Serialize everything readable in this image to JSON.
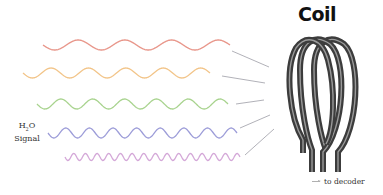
{
  "title": "Coil",
  "signal_label": {
    "prefix": "H",
    "subscript": "2",
    "suffix": "O",
    "line2": "Signal"
  },
  "legend": {
    "label": "to decoder",
    "icon": "arrow-right-icon"
  },
  "waves": [
    {
      "name": "red",
      "color": "#e8968a",
      "x_start": 43,
      "x_end": 230,
      "y_center": 45,
      "amplitude": 5,
      "periods": 4
    },
    {
      "name": "orange",
      "color": "#f2c488",
      "x_start": 23,
      "x_end": 210,
      "y_center": 73,
      "amplitude": 5,
      "periods": 5
    },
    {
      "name": "green",
      "color": "#a8d38e",
      "x_start": 37,
      "x_end": 228,
      "y_center": 104,
      "amplitude": 5,
      "periods": 6
    },
    {
      "name": "blue",
      "color": "#9c9cd8",
      "x_start": 48,
      "x_end": 237,
      "y_center": 133,
      "amplitude": 5,
      "periods": 8
    },
    {
      "name": "purple",
      "color": "#d4a8d8",
      "x_start": 65,
      "x_end": 240,
      "y_center": 157,
      "amplitude": 3.5,
      "periods": 15
    }
  ],
  "connectors": [
    {
      "x1": 232,
      "y1": 51,
      "x2": 269,
      "y2": 67
    },
    {
      "x1": 222,
      "y1": 76,
      "x2": 265,
      "y2": 83
    },
    {
      "x1": 236,
      "y1": 104,
      "x2": 264,
      "y2": 100
    },
    {
      "x1": 240,
      "y1": 128,
      "x2": 270,
      "y2": 115
    },
    {
      "x1": 245,
      "y1": 155,
      "x2": 274,
      "y2": 129
    }
  ],
  "colors": {
    "coil": "#4a4a4a",
    "coil_highlight": "#9a9a9a",
    "connector": "#a8a8b0"
  }
}
